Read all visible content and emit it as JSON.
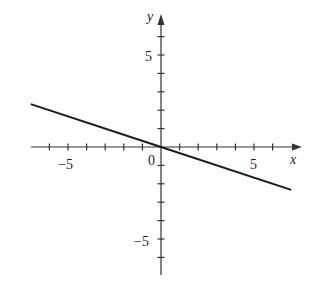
{
  "chart_data": {
    "type": "line",
    "title": "",
    "xlabel": "x",
    "ylabel": "y",
    "xlim": [
      -7,
      7.5
    ],
    "ylim": [
      -7,
      7.5
    ],
    "x_ticks": [
      -6,
      -5,
      -4,
      -3,
      -2,
      -1,
      1,
      2,
      3,
      4,
      5,
      6
    ],
    "y_ticks": [
      -6,
      -5,
      -4,
      -3,
      -2,
      -1,
      1,
      2,
      3,
      4,
      5,
      6
    ],
    "tick_labels": {
      "x": [
        "-5",
        "5"
      ],
      "y": [
        "5",
        "-5"
      ],
      "origin": "0"
    },
    "grid": false,
    "legend": null,
    "series": [
      {
        "name": "y = -x/3",
        "x": [
          -7,
          0,
          7
        ],
        "y": [
          2.33,
          0,
          -2.33
        ]
      }
    ],
    "colors": {
      "axis": "#333333",
      "line": "#1a1a1a",
      "background": "#ffffff"
    }
  },
  "labels": {
    "x_axis": "x",
    "y_axis": "y",
    "origin": "0",
    "x_neg5": "−5",
    "x_pos5": "5",
    "y_pos5": "5",
    "y_neg5": "−5"
  }
}
